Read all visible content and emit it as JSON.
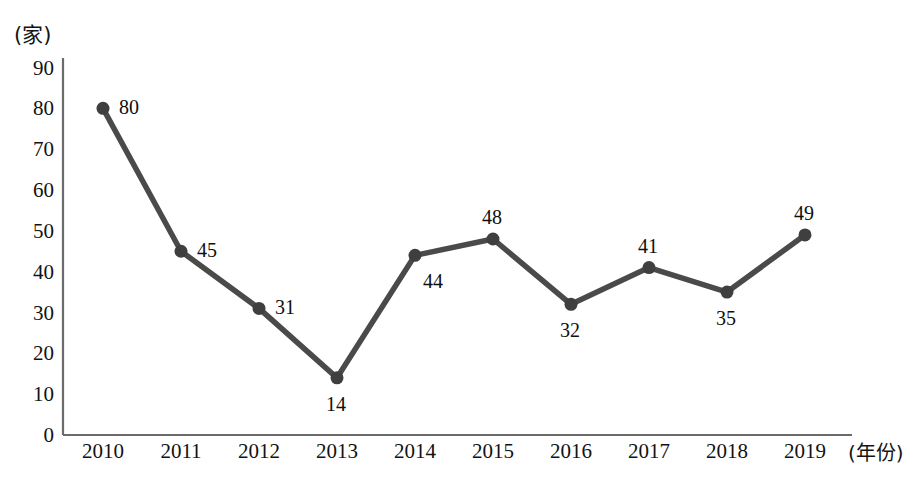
{
  "chart_data": {
    "type": "line",
    "title": "",
    "subtitle": "",
    "xlabel": "(年份)",
    "ylabel": "(家)",
    "categories": [
      "2010",
      "2011",
      "2012",
      "2013",
      "2014",
      "2015",
      "2016",
      "2017",
      "2018",
      "2019"
    ],
    "values": [
      80,
      45,
      31,
      14,
      44,
      48,
      32,
      41,
      35,
      49
    ],
    "point_labels": [
      "80",
      "45",
      "31",
      "14",
      "44",
      "48",
      "32",
      "41",
      "35",
      "49"
    ],
    "y_ticks": [
      "0",
      "10",
      "20",
      "30",
      "40",
      "50",
      "60",
      "70",
      "80",
      "90"
    ],
    "ylim": [
      0,
      90
    ],
    "grid": false,
    "legend": "none",
    "series": [
      {
        "name": "",
        "values": [
          80,
          45,
          31,
          14,
          44,
          48,
          32,
          41,
          35,
          49
        ]
      }
    ],
    "colors": {
      "line": "#4a4a4a",
      "marker": "#3f3f3f",
      "axis": "#6b6b6b",
      "text": "#121212",
      "background": "#ffffff"
    }
  },
  "axes": {
    "y_unit": "(家)",
    "x_unit": "(年份)"
  }
}
